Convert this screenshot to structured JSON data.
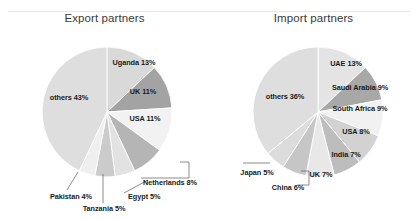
{
  "figure": {
    "background_color": "#ffffff",
    "rule_color": "#e6e6e6"
  },
  "chart_data": [
    {
      "type": "pie",
      "title": "Export partners",
      "panel": "export",
      "center": [
        107,
        112
      ],
      "radius": 65,
      "start_angle_deg": 0,
      "direction": "clockwise",
      "legend": "labels-on-slices",
      "categories": [
        "Uganda",
        "UK",
        "USA",
        "Netherlands",
        "Egypt",
        "Tanzania",
        "Pakistan",
        "others"
      ],
      "values": [
        13,
        11,
        11,
        8,
        5,
        5,
        4,
        43
      ],
      "unit": "%",
      "slices": [
        {
          "label": "Uganda 13%",
          "name": "Uganda",
          "value": 13,
          "color": "#d9d9d9",
          "label_x": 134,
          "label_y": 62,
          "align": "center",
          "callout": false
        },
        {
          "label": "UK 11%",
          "name": "UK",
          "value": 11,
          "color": "#a3a3a3",
          "label_x": 143,
          "label_y": 91,
          "align": "center",
          "callout": false
        },
        {
          "label": "USA 11%",
          "name": "USA",
          "value": 11,
          "color": "#f2f2f2",
          "label_x": 145,
          "label_y": 118,
          "align": "center",
          "callout": false
        },
        {
          "label": "Netherlands 8%",
          "name": "Netherlands",
          "value": 8,
          "color": "#b5b5b5",
          "label_x": 143,
          "label_y": 182,
          "align": "right",
          "callout": true,
          "callout_points": "180,162 189,162 189,178 141,178"
        },
        {
          "label": "Egypt 5%",
          "name": "Egypt",
          "value": 5,
          "color": "#e2e2e2",
          "label_x": 128,
          "label_y": 196,
          "align": "right",
          "callout": true,
          "callout_points": "148,180 124,193"
        },
        {
          "label": "Tanzania 5%",
          "name": "Tanzania",
          "value": 5,
          "color": "#cbcbcb",
          "label_x": 104,
          "label_y": 208,
          "align": "center",
          "callout": true,
          "callout_points": "103,174 103,203"
        },
        {
          "label": "Pakistan 4%",
          "name": "Pakistan",
          "value": 4,
          "color": "#efefef",
          "label_x": 71,
          "label_y": 196,
          "align": "center",
          "callout": true,
          "callout_points": "78,172 67,190"
        },
        {
          "label": "others 43%",
          "name": "others",
          "value": 43,
          "color": "#dedede",
          "label_x": 69,
          "label_y": 97,
          "align": "center",
          "callout": false
        }
      ]
    },
    {
      "type": "pie",
      "title": "Import partners",
      "panel": "import",
      "center": [
        318,
        112
      ],
      "radius": 65,
      "start_angle_deg": 0,
      "direction": "clockwise",
      "legend": "labels-on-slices",
      "categories": [
        "UAE",
        "Saudi Arabia",
        "South Africa",
        "USA",
        "India",
        "UK",
        "China",
        "Japan",
        "others"
      ],
      "values": [
        13,
        9,
        9,
        8,
        7,
        7,
        6,
        5,
        36
      ],
      "unit": "%",
      "slices": [
        {
          "label": "UAE 13%",
          "name": "UAE",
          "value": 13,
          "color": "#e4e4e4",
          "label_x": 137,
          "label_y": 63,
          "align": "center",
          "callout": false
        },
        {
          "label": "Saudi Arabia 9%",
          "name": "Saudi Arabia",
          "value": 9,
          "color": "#a8a8a8",
          "label_x": 151,
          "label_y": 87,
          "align": "center",
          "callout": false
        },
        {
          "label": "South Africa 9%",
          "name": "South Africa",
          "value": 9,
          "color": "#f1f1f1",
          "label_x": 151,
          "label_y": 108,
          "align": "center",
          "callout": false
        },
        {
          "label": "USA 8%",
          "name": "USA",
          "value": 8,
          "color": "#d2d2d2",
          "label_x": 147,
          "label_y": 131,
          "align": "center",
          "callout": false
        },
        {
          "label": "India 7%",
          "name": "India",
          "value": 7,
          "color": "#bdbdbd",
          "label_x": 137,
          "label_y": 154,
          "align": "center",
          "callout": false
        },
        {
          "label": "UK 7%",
          "name": "UK",
          "value": 7,
          "color": "#e8e8e8",
          "label_x": 112,
          "label_y": 174,
          "align": "center",
          "callout": false
        },
        {
          "label": "China 6%",
          "name": "China",
          "value": 6,
          "color": "#c6c6c6",
          "label_x": 79,
          "label_y": 187,
          "align": "center",
          "callout": true,
          "callout_points": "92,171 100,171 100,185 88,185"
        },
        {
          "label": "Japan 5%",
          "name": "Japan",
          "value": 5,
          "color": "#dcdcdc",
          "label_x": 48,
          "label_y": 172,
          "align": "center",
          "callout": true,
          "callout_points": "34,163 61,163"
        },
        {
          "label": "others 36%",
          "name": "others",
          "value": 36,
          "color": "#dedede",
          "label_x": 76,
          "label_y": 96,
          "align": "center",
          "callout": false
        }
      ]
    }
  ]
}
